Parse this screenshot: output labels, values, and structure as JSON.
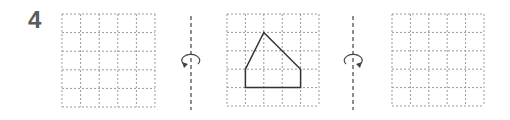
{
  "exercise": {
    "number": "4",
    "grid": {
      "cols": 5,
      "rows": 5
    },
    "panels": [
      {
        "name": "left-grid",
        "x": 62,
        "y": 14,
        "cell": 18.6,
        "shape": null
      },
      {
        "name": "middle-grid",
        "x": 227,
        "y": 14,
        "cell": 18.4,
        "shape": [
          [
            1,
            4
          ],
          [
            1,
            3
          ],
          [
            2,
            1
          ],
          [
            4,
            3
          ],
          [
            4,
            4
          ]
        ]
      },
      {
        "name": "right-grid",
        "x": 392,
        "y": 14,
        "cell": 18.4,
        "shape": null
      }
    ],
    "axes": [
      {
        "name": "left-rotation-axis",
        "x": 191,
        "direction": "counterclockwise-front"
      },
      {
        "name": "right-rotation-axis",
        "x": 353,
        "direction": "clockwise-front"
      }
    ],
    "colors": {
      "grid": "#9a9a9a",
      "shape": "#333333",
      "number": "#5a5a5a",
      "axis": "#444444"
    }
  }
}
